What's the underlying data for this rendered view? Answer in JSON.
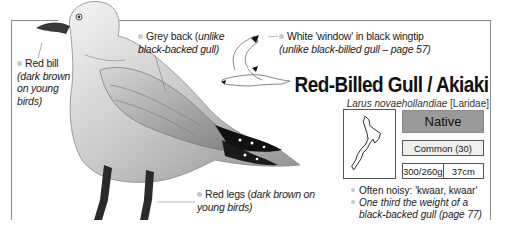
{
  "species": {
    "common_name": "Red-Billed Gull / Akiaki",
    "latin_name": "Larus novaehollandiae",
    "family": "[Laridae]",
    "status": "Native",
    "abundance": "Common (30)",
    "weight": "300/260g",
    "length": "37cm"
  },
  "labels": {
    "bill_main": "Red bill",
    "bill_note": "(dark brown on young birds)",
    "back_main": "Grey back (",
    "back_note": "unlike black-backed gull)",
    "wing_main": "White 'window' in black wingtip",
    "wing_note": "(unlike black-billed gull – page 57)",
    "legs_main": "Red legs (",
    "legs_note": "dark brown on young birds)"
  },
  "notes": [
    "Often noisy: 'kwaar, kwaar'",
    "One third the weight of a black-backed gull (page 77)"
  ],
  "colors": {
    "status_fill": "#9a9a9a",
    "abundance_fill": "#efefef",
    "bullet": "#c8c8c8"
  }
}
